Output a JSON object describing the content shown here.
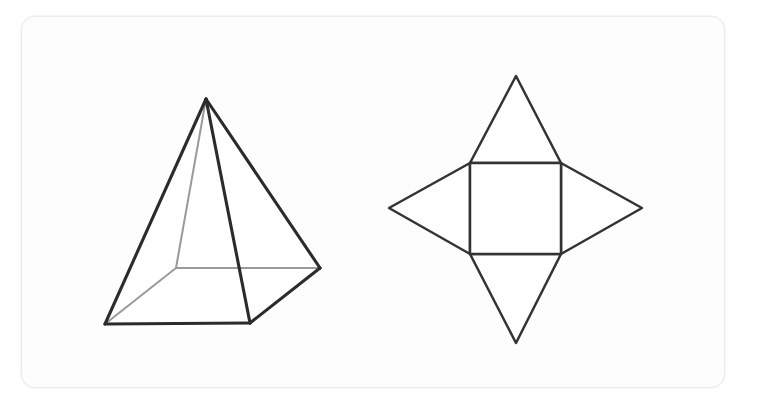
{
  "page": {
    "background_color": "#ffffff",
    "width": 758,
    "height": 410
  },
  "card": {
    "name": "figure-card",
    "background_color": "#fdfdfd",
    "border_color": "#ececef",
    "corner_radius": 14,
    "x": 21,
    "y": 16,
    "width": 704,
    "height": 372
  },
  "figures": [
    {
      "id": "square-pyramid-solid",
      "label": "square pyramid",
      "type": "3d-solid-wireframe",
      "stroke_color": "#2b2b2b",
      "hidden_stroke_color": "#9a9a9a",
      "vertices": {
        "apex": [
          206,
          99
        ],
        "base_front_left": [
          105,
          324
        ],
        "base_front_right": [
          250,
          323
        ],
        "base_back_right": [
          320,
          268
        ],
        "base_back_left": [
          176,
          268
        ]
      },
      "visible_edges": [
        [
          "apex",
          "base_front_left"
        ],
        [
          "apex",
          "base_front_right"
        ],
        [
          "apex",
          "base_back_right"
        ],
        [
          "base_front_left",
          "base_front_right"
        ],
        [
          "base_front_right",
          "base_back_right"
        ]
      ],
      "hidden_edges": [
        [
          "apex",
          "base_back_left"
        ],
        [
          "base_front_left",
          "base_back_left"
        ],
        [
          "base_back_left",
          "base_back_right"
        ]
      ]
    },
    {
      "id": "square-pyramid-net",
      "label": "net of a square pyramid",
      "type": "2d-net",
      "stroke_color": "#333333",
      "square": {
        "left": 470,
        "top": 163,
        "right": 561,
        "bottom": 254
      },
      "apexes": {
        "top": [
          516,
          76
        ],
        "right": [
          642,
          208
        ],
        "bottom": [
          516,
          343
        ],
        "left": [
          389,
          208
        ]
      },
      "triangle_count": 4
    }
  ]
}
